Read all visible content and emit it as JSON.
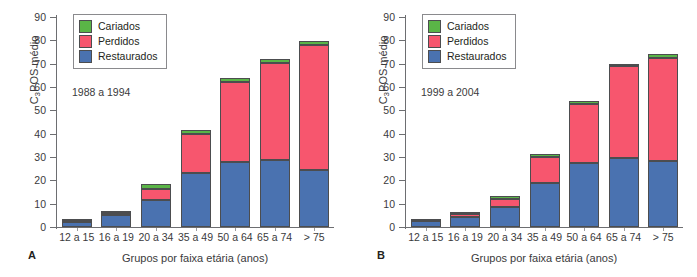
{
  "figure": {
    "panels": [
      {
        "letter": "A",
        "annotation": "1988 a 1994",
        "chart_index": 0
      },
      {
        "letter": "B",
        "annotation": "1999 a 2004",
        "chart_index": 1
      }
    ]
  },
  "legend": {
    "entries": [
      {
        "label": "Cariados",
        "color": "#5AB547"
      },
      {
        "label": "Perdidos",
        "color": "#F7566E"
      },
      {
        "label": "Restaurados",
        "color": "#4A72B0"
      }
    ]
  },
  "axis": {
    "y_ticks": [
      "90",
      "80",
      "70",
      "60",
      "50",
      "40",
      "30",
      "20",
      "10",
      "0"
    ],
    "y_label_prefix": "C",
    "y_label_sub": "3",
    "y_label_suffix": "POS médio",
    "x_title": "Grupos por faixa etária (anos)",
    "x_categories": [
      "12 a 15",
      "16 a 19",
      "20 a 34",
      "35 a 49",
      "50 a 64",
      "65 a 74",
      "> 75"
    ]
  },
  "chart_data": [
    {
      "type": "bar",
      "stacked": true,
      "panel": "A",
      "title": "1988 a 1994",
      "xlabel": "Grupos por faixa etária (anos)",
      "ylabel": "C3POS médio",
      "ylim": [
        0,
        90
      ],
      "ytick_step": 10,
      "grid": false,
      "legend_position": "top-left",
      "categories": [
        "12 a 15",
        "16 a 19",
        "20 a 34",
        "35 a 49",
        "50 a 64",
        "65 a 74",
        "> 75"
      ],
      "series": [
        {
          "name": "Restaurados",
          "color": "#4A72B0",
          "values": [
            2.3,
            5.3,
            11.6,
            23.2,
            27.8,
            28.9,
            24.5
          ]
        },
        {
          "name": "Perdidos",
          "color": "#F7566E",
          "values": [
            0.2,
            0.8,
            4.8,
            16.8,
            34.4,
            41.3,
            53.7
          ]
        },
        {
          "name": "Cariados",
          "color": "#5AB547",
          "values": [
            0.6,
            0.8,
            2.1,
            1.7,
            1.7,
            1.6,
            1.6
          ]
        }
      ],
      "totals": [
        3.1,
        6.9,
        18.5,
        41.7,
        63.9,
        71.8,
        79.8
      ]
    },
    {
      "type": "bar",
      "stacked": true,
      "panel": "B",
      "title": "1999 a 2004",
      "xlabel": "Grupos por faixa etária (anos)",
      "ylabel": "C3POS médio",
      "ylim": [
        0,
        90
      ],
      "ytick_step": 10,
      "grid": false,
      "legend_position": "top-left",
      "categories": [
        "12 a 15",
        "16 a 19",
        "20 a 34",
        "35 a 49",
        "50 a 64",
        "65 a 74",
        "> 75"
      ],
      "series": [
        {
          "name": "Restaurados",
          "color": "#4A72B0",
          "values": [
            2.4,
            4.3,
            8.7,
            18.8,
            27.6,
            29.4,
            28.1
          ]
        },
        {
          "name": "Perdidos",
          "color": "#F7566E",
          "values": [
            0.2,
            1.1,
            3.1,
            11.2,
            25.0,
            39.5,
            44.4
          ]
        },
        {
          "name": "Cariados",
          "color": "#5AB547",
          "values": [
            0.5,
            0.6,
            1.6,
            1.4,
            1.3,
            0.9,
            1.5
          ]
        }
      ],
      "totals": [
        3.1,
        6.0,
        13.4,
        31.4,
        53.9,
        69.8,
        74.0
      ]
    }
  ]
}
